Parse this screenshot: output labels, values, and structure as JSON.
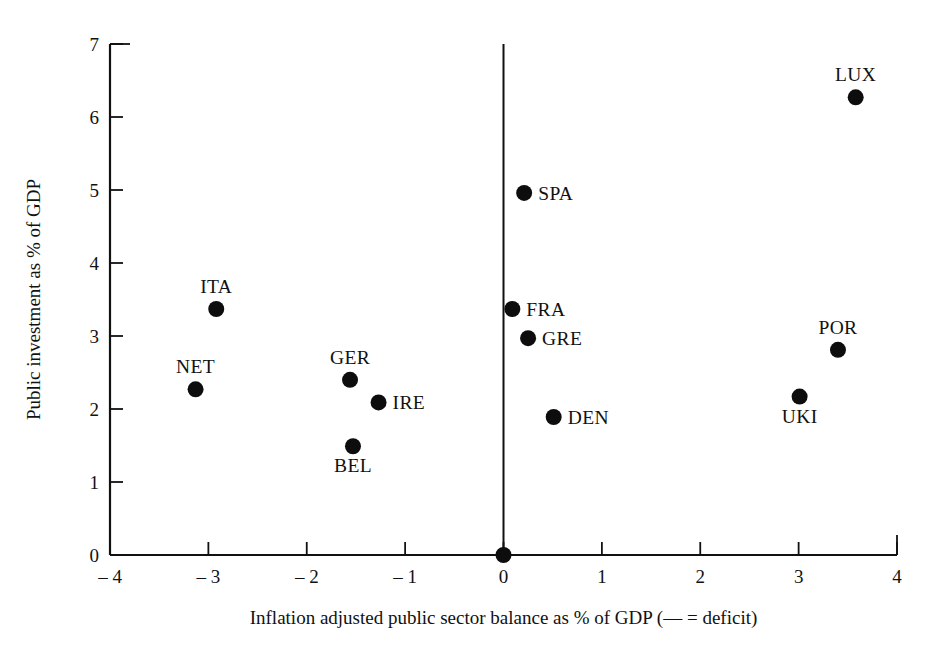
{
  "chart_data": {
    "type": "scatter",
    "title": "",
    "xlabel": "Inflation adjusted public sector balance as % of GDP (— = deficit)",
    "ylabel": "Public investment as % of GDP",
    "xlim": [
      -4,
      4
    ],
    "ylim": [
      0,
      7
    ],
    "xticks": [
      -4,
      -3,
      -2,
      -1,
      0,
      1,
      2,
      3,
      4
    ],
    "xticklabels": [
      "– 4",
      "– 3",
      "– 2",
      "– 1",
      "0",
      "1",
      "2",
      "3",
      "4"
    ],
    "yticks": [
      0,
      1,
      2,
      3,
      4,
      5,
      6,
      7
    ],
    "yticklabels": [
      "0",
      "1",
      "2",
      "3",
      "4",
      "5",
      "6",
      "7"
    ],
    "grid": false,
    "legend": "none",
    "vertical_reference_line": 0,
    "points": [
      {
        "label": "LUX",
        "x": 3.58,
        "y": 6.27,
        "label_pos": "above"
      },
      {
        "label": "SPA",
        "x": 0.21,
        "y": 4.96,
        "label_pos": "right"
      },
      {
        "label": "ITA",
        "x": -2.92,
        "y": 3.37,
        "label_pos": "above"
      },
      {
        "label": "FRA",
        "x": 0.09,
        "y": 3.37,
        "label_pos": "right"
      },
      {
        "label": "GRE",
        "x": 0.25,
        "y": 2.97,
        "label_pos": "right"
      },
      {
        "label": "POR",
        "x": 3.4,
        "y": 2.81,
        "label_pos": "above"
      },
      {
        "label": "GER",
        "x": -1.56,
        "y": 2.4,
        "label_pos": "above"
      },
      {
        "label": "NET",
        "x": -3.13,
        "y": 2.27,
        "label_pos": "above"
      },
      {
        "label": "UKI",
        "x": 3.01,
        "y": 2.17,
        "label_pos": "below"
      },
      {
        "label": "IRE",
        "x": -1.27,
        "y": 2.09,
        "label_pos": "right"
      },
      {
        "label": "DEN",
        "x": 0.51,
        "y": 1.89,
        "label_pos": "right"
      },
      {
        "label": "BEL",
        "x": -1.53,
        "y": 1.49,
        "label_pos": "below"
      },
      {
        "label": "",
        "x": 0.0,
        "y": 0.0,
        "label_pos": "none"
      }
    ],
    "marker": {
      "shape": "circle",
      "color": "#0d0d0d",
      "size": 9
    }
  }
}
